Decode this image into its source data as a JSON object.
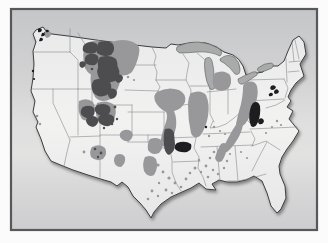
{
  "colors": {
    "page_bg": "#fbfbfb",
    "frame_border": "#58585b",
    "map_bg_stops": [
      [
        0,
        "#c5c6c8"
      ],
      [
        0.3,
        "#d2d2d3"
      ],
      [
        0.52,
        "#dfdfdf"
      ],
      [
        0.66,
        "#e2e2e1"
      ],
      [
        0.82,
        "#d7d7d8"
      ],
      [
        1,
        "#cdcdcf"
      ]
    ],
    "land_stops": [
      [
        0,
        "#e9e9ea"
      ],
      [
        0.5,
        "#f2f2f1"
      ],
      [
        1,
        "#e7e7e8"
      ]
    ],
    "land_outline": "#3e3e42",
    "state_line": "#7e8083",
    "lake": "#a9abaa",
    "lake_outline": "#5a5a5e",
    "coal_medium": "#98989b",
    "coal_dark": "#4d4d50",
    "coal_black": "#1d1d1f",
    "shadow": "#333333"
  },
  "map": {
    "frame": {
      "x": 11,
      "y": 9,
      "w": 306,
      "h": 221,
      "border_width": 2.2
    },
    "outline": "M36,30 L43,27 L46,31 L44,33 Q70,36 96,40 Q124,44 152,47 L166,48 L171,44 L178,45 Q192,41 206,43 Q217,46 224,52 L233,55 Q239,58 243,66 L246,75 L252,74 L263,72 L267,68 Q272,65 278,66 L284,61 L288,51 L293,40 L299,36 L304,42 L306,54 L300,64 L304,76 L296,83 L291,90 L288,97 L291,101 L287,107 L293,111 L289,119 L294,125 L299,131 L293,141 L287,149 L282,157 L279,166 L280,174 L285,186 L286,198 L281,209 L277,213 L271,206 L267,193 L262,181 L254,176 L246,180 L237,182 L227,182 L219,180 L212,184 L216,190 L206,189 L199,183 L191,188 L182,192 L171,197 L161,204 L154,212 L151,218 L146,210 L140,203 L133,196 L128,187 L122,182 L117,186 L111,182 L104,180 L88,175 L73,170 L63,166 L51,161 L45,151 L41,139 L36,127 L38,122 L33,112 L35,101 L31,91 L33,78 L34,64 L33,51 L36,42 L33,34 Z",
    "state_lines": [
      "M34,52 L70,52",
      "M70,29 L70,52",
      "M70,52 L78,60 L78,89",
      "M31,89 L92,89",
      "M53,89 L53,103 L70,140",
      "M70,140 L67,152 L64,166",
      "M78,33 L86,46 L92,56 L92,72",
      "M92,72 L92,105",
      "M92,72 L128,72",
      "M92,105 L132,105",
      "M100,105 L100,177",
      "M78,89 L78,135",
      "M70,137 L100,136",
      "M100,135 L132,135",
      "M132,105 L132,136",
      "M125,43 L125,72",
      "M125,65 L156,65",
      "M125,90 L158,91",
      "M158,91 L163,99 L164,105",
      "M128,112 L164,112",
      "M164,112 L164,135",
      "M128,135 L170,135",
      "M170,135 L170,150",
      "M128,136 L128,142",
      "M148,135 L148,142",
      "M128,142 L148,142 L156,146 L164,148 L170,150",
      "M170,150 L172,160 L172,172 L176,183 L181,191",
      "M152,47 L156,56 L154,64 L157,72 L156,80",
      "M156,80 L186,80",
      "M156,80 L160,87 L158,91",
      "M160,105 L175,106 L191,104",
      "M168,138 L196,137",
      "M173,162 L200,161",
      "M183,54 L189,63 L187,73 L186,80 L191,90 L190,102 L193,112 L192,122 L197,130 L196,138 L194,148 L199,157 L198,168 L203,177 L206,186",
      "M190,86 L208,86",
      "M210,86 L210,114 L214,122",
      "M213,121 L210,128 L218,127 L226,124 L234,118 L241,112 L247,106 L249,101",
      "M228,90 L228,114",
      "M207,92 L236,89",
      "M197,53 L204,59",
      "M248,80 L248,102",
      "M248,80 L284,79",
      "M248,101 L284,99",
      "M286,58 L287,82",
      "M292,42 L294,61",
      "M289,62 L301,61",
      "M288,72 L299,71",
      "M295,40 L299,59",
      "M284,79 L288,88 L285,98",
      "M285,100 L276,105 L266,108",
      "M249,102 L256,108 L259,115",
      "M241,113 L250,123",
      "M250,129 L297,127",
      "M203,134 L250,132",
      "M201,147 L253,145",
      "M251,131 L255,139 L252,146",
      "M252,146 L266,141 L280,150",
      "M267,142 L259,157 L252,171",
      "M217,147 L220,181",
      "M235,146 L238,181",
      "M227,181 L238,181 L252,178 L266,174"
    ],
    "lakes": [
      "M177,47 Q186,42 198,42 Q210,43 218,48 Q224,52 220,56 Q210,51 197,52 Q186,53 180,53 Q175,51 177,47 Z",
      "M205,59 Q210,55 212,61 Q214,68 214,76 L215,85 Q215,91 210,89 Q206,82 205,72 Q204,64 205,59 Z",
      "M220,59 Q227,53 234,57 Q240,62 240,69 Q240,76 235,74 Q230,67 224,63 Q219,61 220,59 Z",
      "M238,79 Q245,75 253,72 Q258,71 257,75 Q250,80 243,84 Q238,85 238,79 Z",
      "M258,68 Q264,63 271,63 Q275,64 272,68 Q266,71 261,72 Q256,71 258,68 Z"
    ],
    "coal_medium": [
      "M112,42 Q123,38 133,42 Q141,45 139,54 Q137,64 132,72 Q125,78 116,74 Q108,69 108,58 Q107,48 112,42 Z",
      "M86,43 Q98,38 110,43 Q118,48 115,60 Q112,72 102,76 Q90,78 85,68 Q81,54 86,43 Z",
      "M94,57 Q107,53 117,58 Q124,65 121,78 Q118,92 111,99 Q101,104 95,97 Q89,87 91,72 Q92,62 94,57 Z",
      "M79,101 Q87,97 93,102 Q97,109 93,117 Q88,123 82,119 Q77,112 79,101 Z",
      "M97,103 Q107,99 114,105 Q118,112 113,121 Q106,128 99,123 Q94,115 97,103 Z",
      "M92,147 Q100,143 105,148 Q108,154 103,159 Q96,162 91,157 Q89,151 92,147 Z",
      "M116,155 Q122,152 125,157 Q126,163 121,167 Q115,167 114,161 Q114,157 116,155 Z",
      "M157,92 Q168,86 179,90 Q187,94 185,102 Q182,109 174,111 Q177,118 176,127 Q174,138 168,145 Q162,149 160,143 Q162,132 166,122 Q168,115 166,112 Q158,108 155,101 Q153,95 157,92 Z",
      "M191,93 Q201,89 206,95 Q210,104 208,116 Q206,128 200,136 Q194,140 191,133 Q188,120 188,106 Q188,97 191,93 Z",
      "M215,73 Q224,69 230,75 Q233,83 228,89 Q220,93 214,88 Q211,80 215,73 Z",
      "M245,83 Q254,79 257,86 Q259,95 255,105 Q251,116 245,124 Q239,130 236,124 Q238,114 241,104 Q243,94 243,88 Q243,84 245,83 Z",
      "M238,122 Q242,118 243,124 Q242,132 237,140 Q232,148 227,152 Q222,153 224,146 Q228,138 232,131 Q235,126 238,122 Z",
      "M221,144 Q226,141 227,147 Q226,155 222,161 Q217,164 215,158 Q217,150 221,144 Z",
      "M150,139 Q158,136 162,141 Q164,148 159,153 Q152,156 148,150 Q147,143 150,139 Z",
      "M145,157 Q152,154 156,159 Q159,167 154,175 Q148,178 144,171 Q142,163 145,157 Z",
      "M45,31 Q49,29 51,33 Q51,37 47,38 Q43,36 45,31 Z",
      "M122,131 Q128,128 132,132 Q134,138 129,141 Q123,142 120,137 Q119,133 122,131 Z"
    ],
    "coal_medium_dots": [
      [
        158,
        165,
        1.6
      ],
      [
        163,
        172,
        1.4
      ],
      [
        169,
        178,
        1.6
      ],
      [
        175,
        183,
        1.4
      ],
      [
        181,
        187,
        1.3
      ],
      [
        159,
        183,
        1.2
      ],
      [
        166,
        190,
        1.4
      ],
      [
        172,
        193,
        1.2
      ],
      [
        186,
        179,
        1.4
      ],
      [
        190,
        173,
        1.3
      ],
      [
        195,
        168,
        1.5
      ],
      [
        201,
        172,
        1.2
      ],
      [
        206,
        166,
        1.4
      ],
      [
        199,
        160,
        1.2
      ],
      [
        152,
        191,
        1.4
      ],
      [
        148,
        199,
        1.3
      ],
      [
        158,
        196,
        1.2
      ],
      [
        210,
        158,
        1.3
      ],
      [
        213,
        170,
        1.2
      ],
      [
        208,
        177,
        1.3
      ],
      [
        214,
        152,
        1.3
      ],
      [
        221,
        157,
        1.2
      ],
      [
        227,
        161,
        1.2
      ],
      [
        224,
        168,
        1.2
      ],
      [
        218,
        174,
        1.2
      ],
      [
        230,
        154,
        1.1
      ],
      [
        214,
        127,
        1.2
      ],
      [
        220,
        131,
        1.1
      ],
      [
        209,
        136,
        1.2
      ],
      [
        225,
        134,
        1.1
      ],
      [
        277,
        121,
        1.2
      ],
      [
        281,
        125,
        1.1
      ],
      [
        272,
        127,
        1.1
      ],
      [
        266,
        133,
        1.1
      ],
      [
        241,
        152,
        1.1
      ],
      [
        247,
        158,
        1.1
      ],
      [
        37,
        116,
        1.3
      ],
      [
        40,
        124,
        1.2
      ],
      [
        84,
        152,
        1.4
      ],
      [
        128,
        77,
        1.2
      ],
      [
        134,
        80,
        1.1
      ]
    ],
    "coal_dark": [
      "M85,44 Q92,40 97,44 Q100,49 95,53 Q87,55 83,51 Q82,46 85,44 Z",
      "M99,42 Q108,39 113,44 Q116,50 111,55 Q103,58 97,53 Q96,46 99,42 Z",
      "M87,55 Q94,52 98,56 Q100,61 95,65 Q88,66 85,62 Q84,57 87,55 Z",
      "M100,57 Q110,54 116,59 Q120,66 114,72 Q104,75 99,69 Q96,62 100,57 Z",
      "M80,62 Q84,60 86,63 Q86,67 82,68 Q78,66 80,62 Z",
      "M100,64 Q112,60 118,67 Q122,75 115,81 Q105,85 99,78 Q95,70 100,64 Z",
      "M94,80 Q104,76 110,82 Q114,89 107,95 Q98,99 93,92 Q90,85 94,80 Z",
      "M109,89 Q115,87 117,92 Q117,98 111,99 Q106,96 109,89 Z",
      "M116,75 Q121,73 123,77 Q123,82 118,83 Q113,80 116,75 Z",
      "M83,107 Q90,104 94,108 Q96,114 91,118 Q84,119 81,114 Q80,110 83,107 Z",
      "M89,117 Q95,114 98,119 Q99,125 93,127 Q87,126 86,121 Q86,118 89,117 Z",
      "M97,105 Q106,102 110,107 Q112,113 106,116 Q98,117 95,111 Q94,107 97,105 Z",
      "M101,115 Q110,112 114,117 Q116,123 109,126 Q101,127 98,120 Q98,116 101,115 Z",
      "M165,129 Q172,127 174,133 L175,144 Q175,152 169,155 Q164,153 164,144 Q163,135 165,129 Z"
    ],
    "coal_dark_dots": [
      [
        115,
        107,
        1.4
      ],
      [
        112,
        124,
        1.3
      ],
      [
        117,
        119,
        1.2
      ],
      [
        104,
        128,
        1.2
      ],
      [
        95,
        149,
        1.3
      ],
      [
        101,
        153,
        1.4
      ],
      [
        98,
        157,
        1.2
      ],
      [
        92,
        69,
        1.3
      ],
      [
        106,
        50,
        1.2
      ]
    ],
    "coal_black": [
      "M177,143 Q185,140 191,144 Q193,149 187,152 Q179,153 175,149 Q174,145 177,143 Z",
      "M253,103 Q258,100 260,106 Q261,114 258,122 Q255,129 251,126 Q248,119 250,110 Q251,105 253,103 Z",
      "M259,119 Q263,117 264,121 Q263,125 259,124 Q257,121 259,119 Z",
      "M271,86 Q274,84 276,87 Q275,90 272,90 Q269,89 271,86 Z",
      "M275,90 Q278,88 279,92 Q278,94 275,94 Q273,92 275,90 Z",
      "M270,93 Q273,92 273,95 Q271,97 269,96 Q268,94 270,93 Z",
      "M38,29 Q41,27 42,30 Q41,33 38,32 Z",
      "M42,33 Q45,32 45,35 Q43,37 41,36 Z",
      "M40,38 Q43,37 43,40 Q41,42 39,41 Z",
      "M46,30 Q48,29 49,31 Q48,33 46,32 Z"
    ],
    "coal_black_dots": [
      [
        33,
        71,
        1.2
      ],
      [
        34,
        79,
        1.1
      ],
      [
        206,
        127,
        1.2
      ]
    ]
  }
}
